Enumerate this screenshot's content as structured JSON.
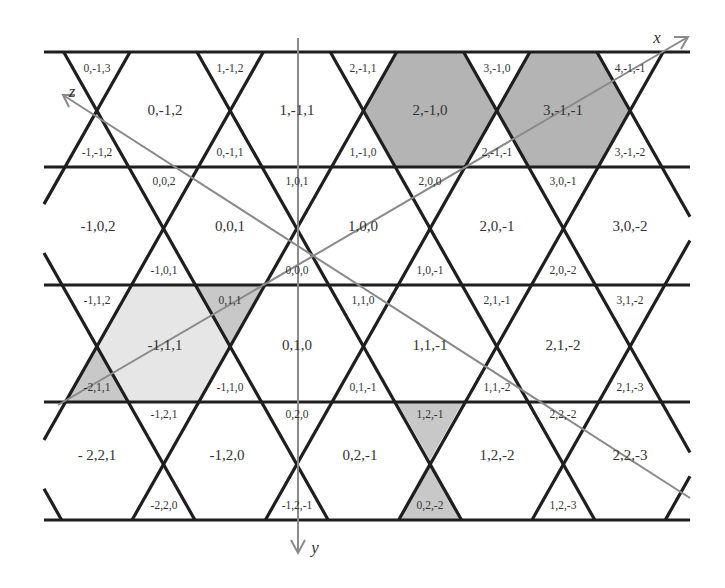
{
  "colors": {
    "line": "#1e1e1e",
    "axis": "#8a8a8a",
    "shade_dark": "#b4b4b4",
    "shade_mid": "#c8c8c8",
    "shade_light": "#e6e6e6",
    "background": "#ffffff"
  },
  "axes": {
    "x": {
      "label": "x"
    },
    "y": {
      "label": "y"
    },
    "z": {
      "label": "z"
    }
  },
  "rows": [
    {
      "hexagons": [
        {
          "label": "0,-1,2",
          "x": 165,
          "y": 110
        },
        {
          "label": "1,-1,1",
          "x": 297,
          "y": 110
        },
        {
          "label": "2,-1,0",
          "x": 430,
          "y": 110,
          "shade": "dark"
        },
        {
          "label": "3,-1,-1",
          "x": 563,
          "y": 110,
          "shade": "dark"
        }
      ],
      "up_triangles": [
        {
          "label": "0,-1,3",
          "x": 97,
          "y": 68
        },
        {
          "label": "1,-1,2",
          "x": 230,
          "y": 68
        },
        {
          "label": "2,-1,1",
          "x": 363,
          "y": 68
        },
        {
          "label": "3,-1,0",
          "x": 497,
          "y": 68
        },
        {
          "label": "4,-1,-1",
          "x": 630,
          "y": 68
        }
      ],
      "down_triangles": [
        {
          "label": "-1,-1,2",
          "x": 97,
          "y": 152
        },
        {
          "label": "0,-1,1",
          "x": 230,
          "y": 152
        },
        {
          "label": "1,-1,0",
          "x": 363,
          "y": 152
        },
        {
          "label": "2,-1,-1",
          "x": 497,
          "y": 152
        },
        {
          "label": "3,-1,-2",
          "x": 630,
          "y": 152
        }
      ]
    },
    {
      "hexagons": [
        {
          "label": "-1,0,2",
          "x": 98,
          "y": 226
        },
        {
          "label": "0,0,1",
          "x": 230,
          "y": 226
        },
        {
          "label": "1,0,0",
          "x": 363,
          "y": 226
        },
        {
          "label": "2,0,-1",
          "x": 497,
          "y": 226
        },
        {
          "label": "3,0,-2",
          "x": 630,
          "y": 226
        }
      ],
      "up_triangles": [
        {
          "label": "0,0,2",
          "x": 164,
          "y": 181
        },
        {
          "label": "1,0,1",
          "x": 297,
          "y": 181
        },
        {
          "label": "2,0,0",
          "x": 430,
          "y": 181
        },
        {
          "label": "3,0,-1",
          "x": 563,
          "y": 181
        }
      ],
      "down_triangles": [
        {
          "label": "-1,0,1",
          "x": 164,
          "y": 270
        },
        {
          "label": "0,0,0",
          "x": 297,
          "y": 270
        },
        {
          "label": "1,0,-1",
          "x": 430,
          "y": 270
        },
        {
          "label": "2,0,-2",
          "x": 563,
          "y": 270
        }
      ]
    },
    {
      "hexagons": [
        {
          "label": "-1,1,1",
          "x": 165,
          "y": 345,
          "shade": "light"
        },
        {
          "label": "0,1,0",
          "x": 297,
          "y": 345
        },
        {
          "label": "1,1,-1",
          "x": 430,
          "y": 345
        },
        {
          "label": "2,1,-2",
          "x": 563,
          "y": 345
        }
      ],
      "up_triangles": [
        {
          "label": "-1,1,2",
          "x": 97,
          "y": 300
        },
        {
          "label": "0,1,1",
          "x": 230,
          "y": 300,
          "shade": "mid"
        },
        {
          "label": "1,1,0",
          "x": 363,
          "y": 300
        },
        {
          "label": "2,1,-1",
          "x": 497,
          "y": 300
        },
        {
          "label": "3,1,-2",
          "x": 630,
          "y": 300
        }
      ],
      "down_triangles": [
        {
          "label": "-2,1,1",
          "x": 97,
          "y": 387,
          "shade": "mid"
        },
        {
          "label": "-1,1,0",
          "x": 230,
          "y": 387
        },
        {
          "label": "0,1,-1",
          "x": 363,
          "y": 387
        },
        {
          "label": "1,1,-2",
          "x": 497,
          "y": 387
        },
        {
          "label": "2,1,-3",
          "x": 630,
          "y": 387
        }
      ]
    },
    {
      "hexagons": [
        {
          "label": "- 2,2,1",
          "x": 97,
          "y": 455
        },
        {
          "label": "-1,2,0",
          "x": 227,
          "y": 455
        },
        {
          "label": "0,2,-1",
          "x": 360,
          "y": 455
        },
        {
          "label": "1,2,-2",
          "x": 497,
          "y": 455
        },
        {
          "label": "2,2,-3",
          "x": 630,
          "y": 455
        }
      ],
      "up_triangles": [
        {
          "label": "-1,2,1",
          "x": 164,
          "y": 414
        },
        {
          "label": "0,2,0",
          "x": 297,
          "y": 414
        },
        {
          "label": "1,2,-1",
          "x": 430,
          "y": 414,
          "shade": "mid"
        },
        {
          "label": "2,2,-2",
          "x": 563,
          "y": 414
        }
      ],
      "down_triangles": [
        {
          "label": "-2,2,0",
          "x": 164,
          "y": 505
        },
        {
          "label": "-1,2,-1",
          "x": 297,
          "y": 505
        },
        {
          "label": "0,2,-2",
          "x": 430,
          "y": 505,
          "shade": "mid"
        },
        {
          "label": "1,2,-3",
          "x": 563,
          "y": 505
        }
      ]
    }
  ]
}
